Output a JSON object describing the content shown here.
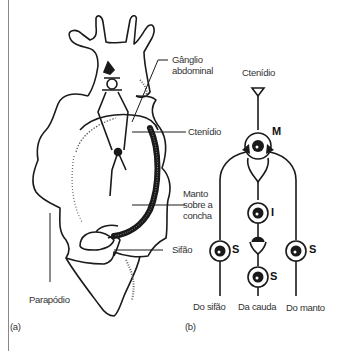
{
  "panel_a": {
    "label": "(a)",
    "annotations": {
      "ganglio_line1": "Gânglio",
      "ganglio_line2": "abdominal",
      "ctenidio": "Ctenídio",
      "manto_line1": "Manto",
      "manto_line2": "sobre a",
      "manto_line3": "concha",
      "sifao": "Sifão",
      "parapodio": "Parapódio"
    }
  },
  "panel_b": {
    "label": "(b)",
    "top_label": "Ctenídio",
    "nodes": {
      "motor": "M",
      "interneuron": "I",
      "sensory_left": "S",
      "sensory_center": "S",
      "sensory_right": "S"
    },
    "inputs": [
      "Do sifão",
      "Da cauda",
      "Do manto"
    ]
  },
  "colors": {
    "ink": "#1a1a1a",
    "text": "#333333",
    "frame": "#888888"
  }
}
